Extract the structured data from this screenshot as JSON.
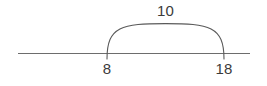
{
  "figure": {
    "type": "number-line-jump-diagram",
    "background_color": "#ffffff",
    "line_color": "#6d6d6d",
    "arc_color": "#5a5a5a",
    "text_color": "#3b3b3b"
  },
  "chart_data": {
    "type": "line",
    "title": "",
    "xlabel": "",
    "ylabel": "",
    "grid": false,
    "legend": null,
    "axis": {
      "orientation": "horizontal",
      "start_px": 18,
      "end_px": 250,
      "y_px": 53
    },
    "ticks": [
      {
        "label": "8",
        "value": 8,
        "x_px": 107
      },
      {
        "label": "18",
        "value": 18,
        "x_px": 224
      }
    ],
    "annotations": [
      {
        "kind": "arc-jump",
        "label": "10",
        "value": 10,
        "from": 8,
        "to": 18,
        "from_px": 107,
        "to_px": 224,
        "apex_y_px": 24
      }
    ]
  },
  "labels": {
    "jump": "10",
    "start": "8",
    "end": "18"
  }
}
